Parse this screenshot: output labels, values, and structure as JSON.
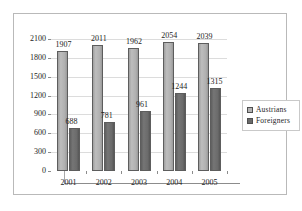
{
  "chart_data": {
    "type": "bar",
    "title": "",
    "xlabel": "",
    "ylabel": "",
    "categories": [
      "2001",
      "2002",
      "2003",
      "2004",
      "2005"
    ],
    "series": [
      {
        "name": "Austrians",
        "color": "#b3b3b3",
        "values": [
          1907,
          2011,
          1962,
          2054,
          2039
        ]
      },
      {
        "name": "Foreigners",
        "color": "#6a6a6a",
        "values": [
          688,
          781,
          961,
          1244,
          1315
        ]
      }
    ],
    "ylim": [
      0,
      2100
    ],
    "yticks": [
      0,
      300,
      600,
      900,
      1200,
      1500,
      1800,
      2100
    ],
    "ytick_labels": [
      "0",
      "300",
      "600",
      "900",
      "1200",
      "1500",
      "1800",
      "2100"
    ],
    "grid": true,
    "legend_position": "right",
    "data_labels": {
      "austrians": [
        "1907",
        "2011",
        "1962",
        "2054",
        "2039"
      ],
      "foreigners": [
        "688",
        "781",
        "961",
        "1244",
        "1315"
      ]
    }
  },
  "legend": {
    "entries": [
      {
        "label": "Austrians",
        "swatch": "legend-swatch-austrians"
      },
      {
        "label": "Foreigners",
        "swatch": "legend-swatch-foreigners"
      }
    ]
  }
}
